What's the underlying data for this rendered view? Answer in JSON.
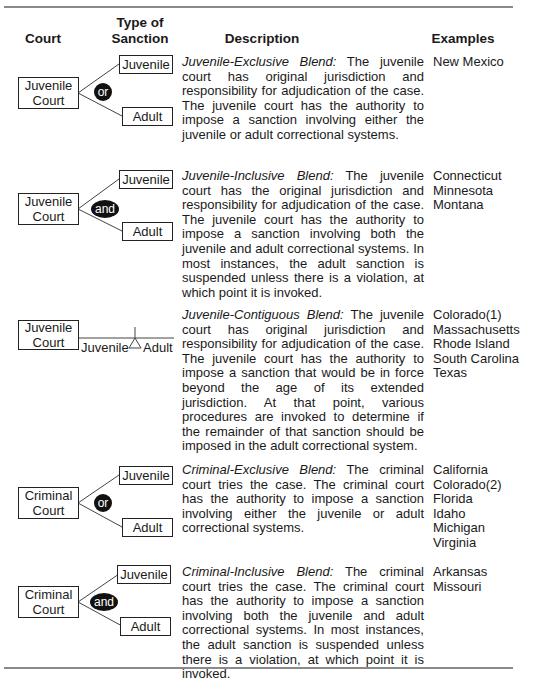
{
  "header": {
    "court": "Court",
    "sanction_line1": "Type of",
    "sanction_line2": "Sanction",
    "description": "Description",
    "examples": "Examples"
  },
  "rows": [
    {
      "court_line1": "Juvenile",
      "court_line2": "Court",
      "connector": "or",
      "sanction_upper": "Juvenile",
      "sanction_lower": "Adult",
      "title": "Juvenile-Exclusive Blend:",
      "text": "The juvenile court has original jurisdiction and responsibility for adjudication of the case. The juvenile court has the authority to impose a sanction involving either the juvenile or adult correctional systems.",
      "examples": [
        "New Mexico"
      ]
    },
    {
      "court_line1": "Juvenile",
      "court_line2": "Court",
      "connector": "and",
      "sanction_upper": "Juvenile",
      "sanction_lower": "Adult",
      "title": "Juvenile-Inclusive Blend:",
      "text": "The juvenile court has the original jurisdiction and responsibility for adjudication of the case. The juvenile court has the authority to impose a sanction involving both the juvenile and adult correctional systems. In most instances, the adult sanction is suspended unless there is a violation, at which point it is invoked.",
      "examples": [
        "Connecticut",
        "Minnesota",
        "Montana"
      ]
    },
    {
      "court_line1": "Juvenile",
      "court_line2": "Court",
      "sanction_left": "Juvenile",
      "sanction_right": "Adult",
      "title": "Juvenile-Contiguous Blend:",
      "text": "The juvenile court has original jurisdiction and responsibility for adjudication of the case. The juvenile court has the authority to impose a sanction that would be in force beyond the age of its extended jurisdiction. At that point, various procedures are invoked to determine if the remainder of that sanction should be imposed in the adult correctional system.",
      "examples": [
        "Colorado(1)",
        "Massachusetts",
        "Rhode Island",
        "South Carolina",
        "Texas"
      ]
    },
    {
      "court_line1": "Criminal",
      "court_line2": "Court",
      "connector": "or",
      "sanction_upper": "Juvenile",
      "sanction_lower": "Adult",
      "title": "Criminal-Exclusive Blend:",
      "text": "The criminal court tries the case. The criminal court has the authority to impose a sanction involving either the juvenile or adult correctional systems.",
      "examples": [
        "California",
        "Colorado(2)",
        "Florida",
        "Idaho",
        "Michigan",
        "Virginia"
      ]
    },
    {
      "court_line1": "Criminal",
      "court_line2": "Court",
      "connector": "and",
      "sanction_upper": "Juvenile",
      "sanction_lower": "Adult",
      "title": "Criminal-Inclusive Blend:",
      "text": "The criminal court tries the case. The criminal court has the authority to impose a sanction involving both the juvenile and adult correctional systems. In most instances, the adult sanction is suspended unless there is a violation, at which point it is invoked.",
      "examples": [
        "Arkansas",
        "Missouri"
      ]
    }
  ]
}
